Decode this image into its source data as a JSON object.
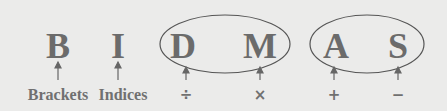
{
  "diagram": {
    "colors": {
      "background": "#ebebea",
      "text": "#6b6b6b",
      "lines": "#555555"
    },
    "items": [
      {
        "letter": "B",
        "label": "Brackets",
        "x": 58
      },
      {
        "letter": "I",
        "label": "Indices",
        "x": 118
      },
      {
        "letter": "D",
        "label": "÷",
        "x": 183
      },
      {
        "letter": "M",
        "label": "×",
        "x": 260
      },
      {
        "letter": "A",
        "label": "+",
        "x": 336
      },
      {
        "letter": "S",
        "label": "−",
        "x": 398
      }
    ],
    "groups": [
      {
        "name": "division-multiplication",
        "members": [
          "D",
          "M"
        ]
      },
      {
        "name": "addition-subtraction",
        "members": [
          "A",
          "S"
        ]
      }
    ]
  }
}
